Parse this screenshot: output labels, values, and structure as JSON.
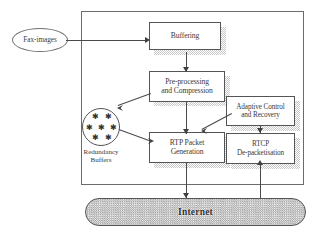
{
  "diagram": {
    "source_node": {
      "label": "Fax-images",
      "shape": "rounded-ellipse"
    },
    "system_boundary": {
      "label": "",
      "shape": "rectangle"
    },
    "blocks": [
      {
        "id": "buffering",
        "label": "Buffering",
        "lines": [
          "Buffering"
        ]
      },
      {
        "id": "preprocessing",
        "label": "Pre-processing and Compression",
        "lines": [
          "Pre-processing",
          "and Compression"
        ]
      },
      {
        "id": "rtp",
        "label": "RTP Packet Generation",
        "lines": [
          "RTP Packet",
          "Generation"
        ]
      },
      {
        "id": "adaptive",
        "label": "Adaptive Control and Recovery",
        "lines": [
          "Adaptive Control",
          "and Recovery"
        ]
      },
      {
        "id": "rtcp",
        "label": "RTCP De-packetisation",
        "lines": [
          "RTCP",
          "De-packetisation"
        ]
      }
    ],
    "redundancy": {
      "label_lines": [
        "Redundancy",
        "Buffers"
      ],
      "glyph": "asterisk",
      "glyph_count": 7
    },
    "network": {
      "label": "Internet",
      "shape": "stadium",
      "fill": "checkered-gray"
    },
    "connections": [
      {
        "from": "Fax-images",
        "to": "Buffering",
        "style": "arrow-right"
      },
      {
        "from": "Buffering",
        "to": "Pre-processing and Compression",
        "style": "arrow-down"
      },
      {
        "from": "Pre-processing and Compression",
        "to": "Redundancy Buffers",
        "style": "arrow-diagonal"
      },
      {
        "from": "Pre-processing and Compression",
        "to": "RTP Packet Generation",
        "style": "arrow-down"
      },
      {
        "from": "Redundancy Buffers",
        "to": "RTP Packet Generation",
        "style": "arrow-diagonal"
      },
      {
        "from": "Adaptive Control and Recovery",
        "to": "RTP Packet Generation",
        "style": "arrow-diagonal"
      },
      {
        "from": "Adaptive Control and Recovery",
        "to": "RTCP De-packetisation",
        "style": "arrow-down"
      },
      {
        "from": "RTP Packet Generation",
        "to": "Internet",
        "style": "arrow-down"
      },
      {
        "from": "Internet",
        "to": "RTCP De-packetisation",
        "style": "arrow-up"
      }
    ]
  },
  "colors": {
    "line": "#4a4a4a",
    "box_border": "#555555",
    "boundary_border": "#6b6b6b",
    "shadow": "#c9c9c9",
    "network_fill": "#d8d8d8",
    "text": "#3a3a3a",
    "page_background": "#ffffff"
  }
}
